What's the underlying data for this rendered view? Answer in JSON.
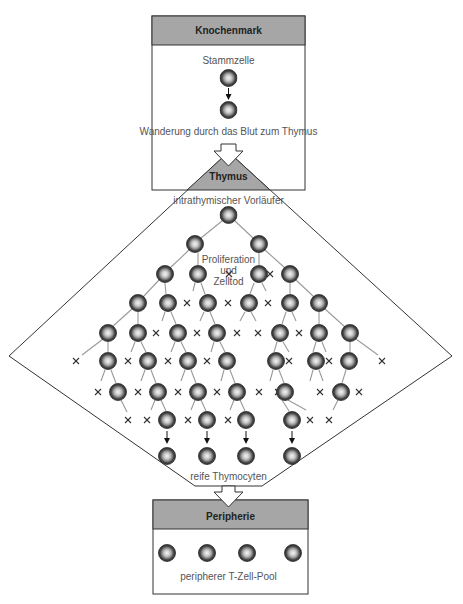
{
  "bone_marrow": {
    "title": "Knochenmark",
    "stem_cell_label": "Stammzelle",
    "migration_label": "Wanderung durch das Blut zum Thymus"
  },
  "thymus": {
    "title": "Thymus",
    "precursor_label": "intrathymischer Vorläufer",
    "process_label_line1": "Proliferation",
    "process_label_line2": "und",
    "process_label_line3": "Zelltod",
    "mature_label": "reife Thymocyten"
  },
  "periphery": {
    "title": "Peripherie",
    "pool_label": "peripherer T-Zell-Pool"
  },
  "colors": {
    "header_fill": "#a6a6a6",
    "border": "#333333",
    "cell_outer": "#3a3a3a",
    "cell_inner": "#e8e8e8",
    "branch_line": "#9a9a9a",
    "death_mark": "#333333"
  },
  "legend": {
    "cell_icon": "cell-icon",
    "death_icon": "cross-icon"
  }
}
